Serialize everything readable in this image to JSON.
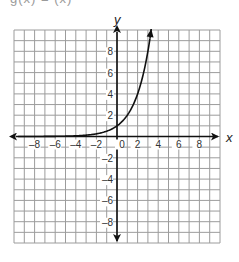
{
  "header": {
    "cut_off_label": "g(x) = (x)"
  },
  "chart_data": {
    "type": "line",
    "title": "",
    "xlabel": "x",
    "ylabel": "y",
    "xlim": [
      -10,
      10
    ],
    "ylim": [
      -10,
      10
    ],
    "grid": true,
    "x_ticks": [
      "-8",
      "-6",
      "-4",
      "-2",
      "0",
      "2",
      "4",
      "6",
      "8"
    ],
    "y_ticks": [
      "8",
      "6",
      "4",
      "2",
      "-2",
      "-4",
      "-6",
      "-8"
    ],
    "series": [
      {
        "name": "exponential curve (approx. y = 2^x)",
        "x": [
          -9.5,
          -6,
          -4,
          -2,
          -1,
          0,
          1,
          2,
          3,
          3.32
        ],
        "y": [
          0.0,
          0.016,
          0.06,
          0.25,
          0.5,
          1,
          2,
          4,
          8,
          10
        ]
      }
    ],
    "colors": {
      "grid": "#9c9c9c",
      "axis": "#111111",
      "curve": "#111111"
    }
  }
}
